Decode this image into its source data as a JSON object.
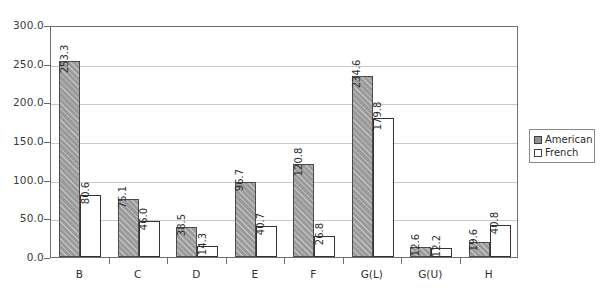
{
  "chart_data": {
    "type": "bar",
    "title": "",
    "subtitle": "",
    "xlabel": "",
    "ylabel": "",
    "categories": [
      "B",
      "C",
      "D",
      "E",
      "F",
      "G(L)",
      "G(U)",
      "H"
    ],
    "series": [
      {
        "name": "American",
        "color": "#9b9b9b",
        "values": [
          253.3,
          75.1,
          38.5,
          96.7,
          120.8,
          234.6,
          12.6,
          19.6
        ],
        "value_labels": [
          "253.3",
          "75.1",
          "38.5",
          "96.7",
          "120.8",
          "234.6",
          "12.6",
          "19.6"
        ]
      },
      {
        "name": "French",
        "color": "#ffffff",
        "values": [
          80.6,
          46.0,
          14.3,
          40.7,
          26.8,
          179.8,
          12.2,
          40.8
        ],
        "value_labels": [
          "80.6",
          "46.0",
          "14.3",
          "40.7",
          "26.8",
          "179.8",
          "12.2",
          "40.8"
        ]
      }
    ],
    "ylim": [
      0,
      300
    ],
    "ytick_values": [
      0,
      50,
      100,
      150,
      200,
      250,
      300
    ],
    "ytick_labels": [
      "0.0",
      "50.0",
      "100.0",
      "150.0",
      "200.0",
      "250.0",
      "300.0"
    ],
    "grid": true,
    "grid_axis": "y",
    "legend_position": "right",
    "legend_entries": [
      "American",
      "French"
    ],
    "data_labels": true,
    "data_label_rotation": 90
  }
}
